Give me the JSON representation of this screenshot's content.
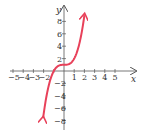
{
  "chart_data": {
    "type": "line",
    "title": "",
    "xlabel": "x",
    "ylabel": "y",
    "xlim": [
      -5.5,
      6
    ],
    "ylim": [
      -10,
      10
    ],
    "grid": false,
    "x_ticks": [
      -5,
      -4,
      -3,
      -2,
      -1,
      1,
      2,
      3,
      4,
      5
    ],
    "x_tick_labels": [
      "-5",
      "-4",
      "-3",
      "-2",
      "",
      "1",
      "2",
      "3",
      "4",
      "5"
    ],
    "y_ticks": [
      -8,
      -6,
      -4,
      -2,
      2,
      4,
      6,
      8
    ],
    "y_tick_labels": [
      "-8",
      "-6",
      "-4",
      "-2",
      "2",
      "4",
      "6",
      "8"
    ],
    "series": [
      {
        "name": "y = x^3 + 1",
        "color": "#e8415a",
        "x": [
          -2.1,
          -2.0,
          -1.75,
          -1.5,
          -1.25,
          -1.0,
          -0.75,
          -0.5,
          -0.25,
          0,
          0.25,
          0.5,
          0.75,
          1.0,
          1.25,
          1.5,
          1.75,
          2.0
        ],
        "y": [
          -8.26,
          -7.0,
          -4.36,
          -2.38,
          -0.95,
          0.0,
          0.58,
          0.88,
          0.98,
          1.0,
          1.02,
          1.13,
          1.42,
          2.0,
          2.95,
          4.38,
          6.36,
          9.0
        ],
        "arrows": "both"
      }
    ]
  },
  "colors": {
    "curve": "#e8415a",
    "axis": "#555555"
  }
}
